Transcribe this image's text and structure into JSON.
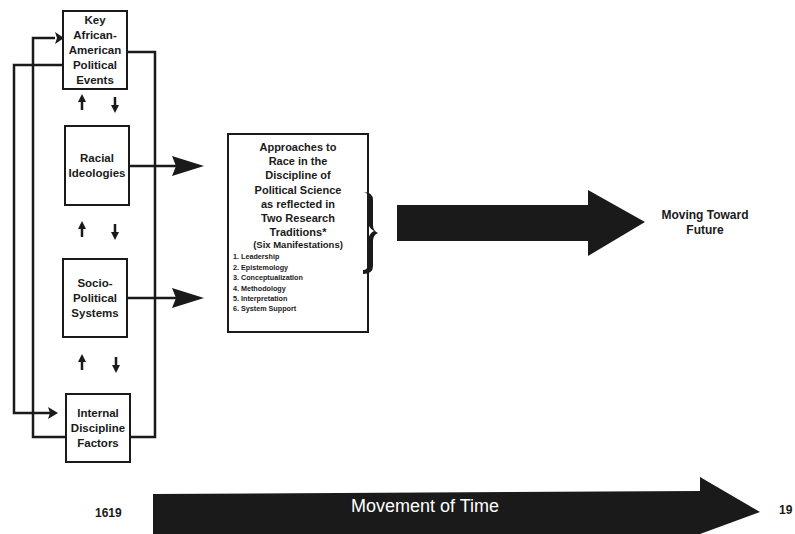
{
  "diagram": {
    "left_boxes": [
      {
        "label": "Key\nAfrican-\nAmerican\nPolitical\nEvents"
      },
      {
        "label": "Racial\nIdeologies"
      },
      {
        "label": "Socio-\nPolitical\nSystems"
      },
      {
        "label": "Internal\nDiscipline\nFactors"
      }
    ],
    "center_box": {
      "title": "Approaches to\nRace in the\nDiscipline of\nPolitical Science\nas reflected in\nTwo Research\nTraditions*",
      "subtitle": "(Six Manifestations)",
      "items": [
        "1. Leadership",
        "2. Epistemology",
        "3. Conceptualization",
        "4. Methodology",
        "5. Interpretation",
        "6. System Support"
      ]
    },
    "future_label": "Moving Toward\nFuture",
    "timeline": {
      "start_year": "1619",
      "end_year": "19",
      "label": "Movement of  Time"
    },
    "colors": {
      "ink": "#1a1a1a",
      "background": "#ffffff"
    }
  }
}
